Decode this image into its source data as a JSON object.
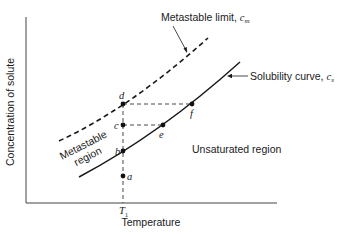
{
  "diagram": {
    "axes": {
      "ylabel": "Concentration of solute",
      "xlabel": "Temperature",
      "x_tick": "T",
      "x_tick_sub": "1"
    },
    "curves": {
      "metastable_limit": {
        "label": "Metastable limit, ",
        "symbol": "c",
        "symbol_sub": "m",
        "style": "dashed"
      },
      "solubility": {
        "label": "Solubility curve, ",
        "symbol": "c",
        "symbol_sub": "s",
        "style": "solid"
      }
    },
    "regions": {
      "metastable": [
        "Metastable",
        "region"
      ],
      "unsaturated": "Unsaturated region"
    },
    "points": [
      {
        "id": "a",
        "label": "a"
      },
      {
        "id": "b",
        "label": "b"
      },
      {
        "id": "c",
        "label": "c"
      },
      {
        "id": "d",
        "label": "d"
      },
      {
        "id": "e",
        "label": "e"
      },
      {
        "id": "f",
        "label": "f"
      }
    ],
    "colors": {
      "line": "#1a1a1a",
      "background": "#ffffff"
    }
  }
}
